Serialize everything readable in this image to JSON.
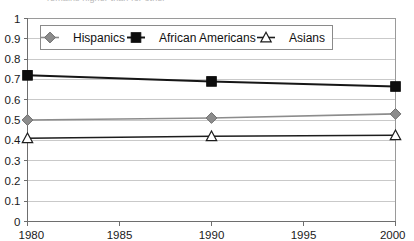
{
  "caption": {
    "partial_text": "remains higher than for other"
  },
  "chart_data": {
    "type": "line",
    "title": "",
    "xlabel": "",
    "ylabel": "",
    "x": [
      1980,
      1990,
      2000
    ],
    "xlim": [
      1980,
      2000
    ],
    "ylim": [
      0,
      1
    ],
    "grid": true,
    "legend_position": "top-inside",
    "x_tick_labels": [
      "1980",
      "1985",
      "1990",
      "1995",
      "2000"
    ],
    "x_tick_values": [
      1980,
      1985,
      1990,
      1995,
      2000
    ],
    "y_tick_labels": [
      "0",
      "0.1",
      "0.2",
      "0.3",
      "0.4",
      "0.5",
      "0.6",
      "0.7",
      "0.8",
      "0.9",
      "1"
    ],
    "y_tick_values": [
      0,
      0.1,
      0.2,
      0.3,
      0.4,
      0.5,
      0.6,
      0.7,
      0.8,
      0.9,
      1
    ],
    "series": [
      {
        "name": "Hispanics",
        "marker": "diamond",
        "color": "#8c8c8c",
        "values": [
          0.5,
          0.51,
          0.53
        ]
      },
      {
        "name": "African Americans",
        "marker": "square",
        "color": "#0d0d0d",
        "values": [
          0.72,
          0.69,
          0.665
        ]
      },
      {
        "name": "Asians",
        "marker": "triangle",
        "color": "#1d1d1d",
        "values": [
          0.41,
          0.42,
          0.425
        ]
      }
    ]
  },
  "legend": {
    "items": [
      {
        "label": "Hispanics"
      },
      {
        "label": "African Americans"
      },
      {
        "label": "Asians"
      }
    ]
  }
}
